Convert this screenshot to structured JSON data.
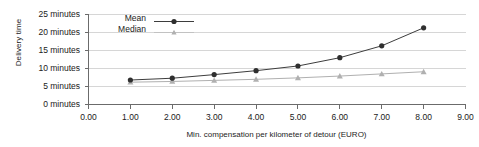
{
  "chart_data": {
    "type": "line",
    "title": "",
    "xlabel": "Min. compensation per kilometer of detour (EURO)",
    "ylabel": "Delivery time",
    "x": [
      1.0,
      2.0,
      3.0,
      4.0,
      5.0,
      6.0,
      7.0,
      8.0
    ],
    "xlim": [
      0.0,
      9.0
    ],
    "ylim": [
      0,
      25
    ],
    "xticks": [
      "0.00",
      "1.00",
      "2.00",
      "3.00",
      "4.00",
      "5.00",
      "6.00",
      "7.00",
      "8.00",
      "9.00"
    ],
    "yticks": [
      "0 minutes",
      "5 minutes",
      "10 minutes",
      "15 minutes",
      "20 minutes",
      "25 minutes"
    ],
    "grid": true,
    "legend_position": "top-left",
    "series": [
      {
        "name": "Mean",
        "marker": "circle",
        "color": "#3d3d3d",
        "values": [
          6.8,
          7.3,
          8.3,
          9.4,
          10.7,
          13.0,
          16.3,
          21.3
        ]
      },
      {
        "name": "Median",
        "marker": "triangle",
        "color": "#b0b0b0",
        "values": [
          6.2,
          6.4,
          6.7,
          7.0,
          7.4,
          7.9,
          8.5,
          9.1
        ]
      }
    ]
  },
  "legend": {
    "items": [
      {
        "label": "Mean",
        "marker": "circle-marker",
        "color": "#3d3d3d"
      },
      {
        "label": "Median",
        "marker": "triangle-marker",
        "color": "#b0b0b0"
      }
    ]
  },
  "axes": {
    "y_title": "Delivery time",
    "x_title": "Min. compensation per kilometer of detour (EURO)"
  },
  "colors": {
    "mean": "#3d3d3d",
    "median": "#b0b0b0",
    "grid": "#d6d6d6",
    "axis": "#6b6b6b",
    "text": "#1a1a1a"
  }
}
